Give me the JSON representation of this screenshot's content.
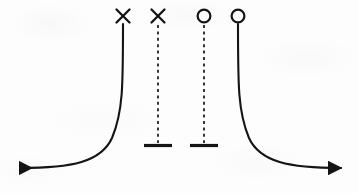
{
  "figure": {
    "background_color": "#fdfdfd",
    "ink_color": "#141414",
    "width": 358,
    "height": 193
  },
  "chart_data": {
    "type": "line",
    "title": "",
    "xlabel": "",
    "ylabel": "",
    "grid": false,
    "legend": null,
    "xlim": [
      0,
      358
    ],
    "ylim": [
      0,
      193
    ],
    "markers": [
      {
        "id": "marker-1",
        "symbol": "cross",
        "x": 123,
        "y": 16,
        "size": 13,
        "attached_line": "solid-left-branch"
      },
      {
        "id": "marker-2",
        "symbol": "cross",
        "x": 158,
        "y": 16,
        "size": 13,
        "attached_line": "dashed-left-interior"
      },
      {
        "id": "marker-3",
        "symbol": "circle",
        "x": 204,
        "y": 16,
        "size": 13,
        "attached_line": "dashed-right-interior"
      },
      {
        "id": "marker-4",
        "symbol": "circle",
        "x": 238,
        "y": 16,
        "size": 13,
        "attached_line": "solid-right-branch"
      }
    ],
    "series": [
      {
        "name": "left-branch",
        "style": "solid",
        "x": [
          123,
          123,
          123,
          122,
          120,
          116,
          110,
          100,
          86,
          68,
          48,
          28,
          14
        ],
        "y": [
          24,
          50,
          80,
          96,
          110,
          126,
          140,
          152,
          160,
          165,
          167,
          168,
          168
        ],
        "arrow": "left-end",
        "vertical_asymptote_x": 123,
        "horizontal_asymptote_y": 168
      },
      {
        "name": "right-branch",
        "style": "solid",
        "x": [
          238,
          238,
          238,
          239,
          241,
          245,
          251,
          261,
          275,
          293,
          313,
          333,
          347
        ],
        "y": [
          24,
          50,
          80,
          96,
          110,
          126,
          140,
          152,
          160,
          165,
          167,
          168,
          168
        ],
        "arrow": "right-end",
        "vertical_asymptote_x": 238,
        "horizontal_asymptote_y": 168
      },
      {
        "name": "left-interior-asymptote",
        "style": "dashed",
        "x": [
          158,
          158
        ],
        "y": [
          25,
          144
        ],
        "terminator": "tick-bar",
        "tick_half_width": 14,
        "tick_y": 145
      },
      {
        "name": "right-interior-asymptote",
        "style": "dashed",
        "x": [
          204,
          204
        ],
        "y": [
          25,
          144
        ],
        "terminator": "tick-bar",
        "tick_half_width": 14,
        "tick_y": 145
      }
    ]
  },
  "elements": {
    "marker_cross_left_label": "×",
    "marker_cross_right_label": "×",
    "marker_circle_left_label": "○",
    "marker_circle_right_label": "○"
  }
}
